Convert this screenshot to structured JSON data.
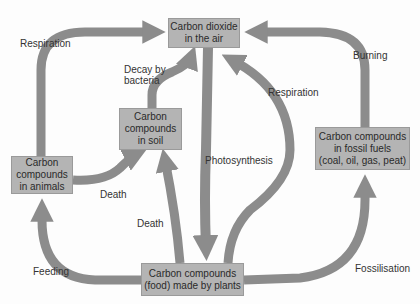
{
  "diagram": {
    "colors": {
      "box_fill": "#b4b4b4",
      "arrow": "#8c8c8c",
      "text": "#2a2a2a"
    },
    "nodes": {
      "air": "Carbon dioxide in the air",
      "soil": "Carbon compounds in soil",
      "animals": "Carbon compounds in animals",
      "fossil": "Carbon compounds in fossil fuels (coal, oil, gas, peat)",
      "plants": "Carbon compounds (food) made by plants"
    },
    "node_lines": {
      "air": [
        "Carbon dioxide",
        "in the air"
      ],
      "soil": [
        "Carbon",
        "compounds",
        "in soil"
      ],
      "animals": [
        "Carbon",
        "compounds",
        "in animals"
      ],
      "fossil": [
        "Carbon compounds",
        "in fossil fuels",
        "(coal, oil, gas, peat)"
      ],
      "plants": [
        "Carbon compounds",
        "(food) made by plants"
      ]
    },
    "edges": [
      {
        "from": "animals",
        "to": "air",
        "label": "Respiration"
      },
      {
        "from": "soil",
        "to": "air",
        "label": "Decay by bacteria"
      },
      {
        "from": "plants",
        "to": "air",
        "label": "Respiration"
      },
      {
        "from": "fossil",
        "to": "air",
        "label": "Burning"
      },
      {
        "from": "air",
        "to": "plants",
        "label": "Photosynthesis"
      },
      {
        "from": "animals",
        "to": "soil",
        "label": "Death"
      },
      {
        "from": "plants",
        "to": "soil",
        "label": "Death"
      },
      {
        "from": "plants",
        "to": "animals",
        "label": "Feeding"
      },
      {
        "from": "plants",
        "to": "fossil",
        "label": "Fossilisation"
      }
    ],
    "labels": {
      "respiration_left": "Respiration",
      "decay_1": "Decay by",
      "decay_2": "bacteria",
      "respiration_right": "Respiration",
      "burning": "Burning",
      "photosynthesis": "Photosynthesis",
      "death_animals": "Death",
      "death_plants": "Death",
      "feeding": "Feeding",
      "fossilisation": "Fossilisation"
    }
  }
}
